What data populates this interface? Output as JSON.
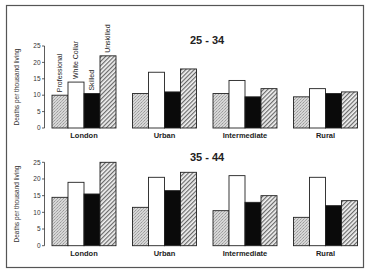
{
  "chart_data": {
    "type": "bar",
    "ylabel": "Deaths per thousand living",
    "ylim": [
      0,
      25
    ],
    "yticks": [
      0,
      5,
      10,
      15,
      20,
      25
    ],
    "grid": false,
    "legend": {
      "placement": "above-first-group",
      "orientation": "vertical-text",
      "entries": [
        "Professional",
        "White Collar",
        "Skilled",
        "Unskilled"
      ]
    },
    "categories": [
      "London",
      "Urban",
      "Intermediate",
      "Rural"
    ],
    "series_styles": {
      "Professional": {
        "fill": "stipple",
        "color": "#c8c8c8"
      },
      "White Collar": {
        "fill": "solid",
        "color": "#ffffff"
      },
      "Skilled": {
        "fill": "solid",
        "color": "#0a0a0a"
      },
      "Unskilled": {
        "fill": "diagonal-hatch",
        "color": "#888888"
      }
    },
    "panels": [
      {
        "title": "25 - 34",
        "series": [
          {
            "name": "Professional",
            "values": [
              10,
              10.5,
              10.5,
              9.5
            ]
          },
          {
            "name": "White Collar",
            "values": [
              14,
              17,
              14.5,
              12
            ]
          },
          {
            "name": "Skilled",
            "values": [
              10.5,
              11,
              9.5,
              10.5
            ]
          },
          {
            "name": "Unskilled",
            "values": [
              22,
              18,
              12,
              11
            ]
          }
        ]
      },
      {
        "title": "35 - 44",
        "series": [
          {
            "name": "Professional",
            "values": [
              14.5,
              11.5,
              10.5,
              8.5
            ]
          },
          {
            "name": "White Collar",
            "values": [
              19,
              20.5,
              21,
              20.5
            ]
          },
          {
            "name": "Skilled",
            "values": [
              15.5,
              16.5,
              13,
              12
            ]
          },
          {
            "name": "Unskilled",
            "values": [
              25,
              22,
              15,
              13.5
            ]
          }
        ]
      }
    ]
  }
}
